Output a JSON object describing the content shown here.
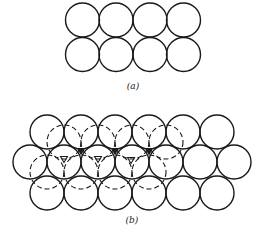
{
  "figure": {
    "part_a": {
      "label": "(a)",
      "label_pos": [
        133,
        89
      ],
      "radius": 17,
      "solid_circles": [
        [
          82.5,
          20
        ],
        [
          116,
          20
        ],
        [
          150,
          20
        ],
        [
          183.5,
          20
        ],
        [
          82.5,
          54.5
        ],
        [
          116,
          54.5
        ],
        [
          150,
          54.5
        ],
        [
          183.5,
          54.5
        ]
      ]
    },
    "part_b": {
      "label": "(b)",
      "label_pos": [
        132,
        223
      ],
      "radius": 17,
      "solid_circles": [
        [
          47,
          132
        ],
        [
          81,
          132
        ],
        [
          115,
          132
        ],
        [
          149,
          132
        ],
        [
          183,
          132
        ],
        [
          217,
          132
        ],
        [
          30,
          162
        ],
        [
          64,
          162
        ],
        [
          98,
          162
        ],
        [
          132,
          162
        ],
        [
          166,
          162
        ],
        [
          200,
          162
        ],
        [
          234,
          162
        ],
        [
          47,
          193
        ],
        [
          81,
          193
        ],
        [
          115,
          193
        ],
        [
          149,
          193
        ],
        [
          183,
          193
        ],
        [
          217,
          193
        ]
      ],
      "dashed_circles": [
        [
          64,
          142
        ],
        [
          98,
          142
        ],
        [
          132,
          142
        ],
        [
          166,
          142
        ],
        [
          47,
          172
        ],
        [
          81,
          172
        ],
        [
          115,
          172
        ],
        [
          149,
          172
        ]
      ],
      "hollow_triangle_markers": [
        [
          64,
          159
        ],
        [
          98,
          159
        ],
        [
          131,
          160
        ]
      ],
      "dark_markers": [
        [
          81,
          151
        ],
        [
          115,
          151
        ],
        [
          149,
          151
        ]
      ]
    }
  }
}
